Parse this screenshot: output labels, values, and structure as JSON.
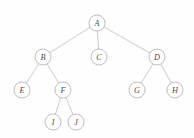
{
  "diagram": {
    "type": "tree",
    "background_color": "#fefefe",
    "node_fill_color": "#ffffff",
    "node_stroke_color": "#a8a8a8",
    "edge_color": "#b3b3b3",
    "label_color": "#4d4d4d",
    "node_radius": 8,
    "nodes": [
      {
        "id": "A",
        "label": "A",
        "x": 97,
        "y": 23,
        "level": 0
      },
      {
        "id": "B",
        "label": "B",
        "x": 43,
        "y": 57,
        "level": 1
      },
      {
        "id": "C",
        "label": "C",
        "x": 99,
        "y": 57,
        "level": 1
      },
      {
        "id": "D",
        "label": "D",
        "x": 157,
        "y": 57,
        "level": 1
      },
      {
        "id": "E",
        "label": "E",
        "x": 22,
        "y": 90,
        "level": 2
      },
      {
        "id": "F",
        "label": "F",
        "x": 63,
        "y": 90,
        "level": 2
      },
      {
        "id": "G",
        "label": "G",
        "x": 137,
        "y": 90,
        "level": 2
      },
      {
        "id": "H",
        "label": "H",
        "x": 175,
        "y": 90,
        "level": 2
      },
      {
        "id": "I",
        "label": "I",
        "x": 53,
        "y": 122,
        "level": 3
      },
      {
        "id": "J",
        "label": "J",
        "x": 76,
        "y": 122,
        "level": 3
      }
    ],
    "edges": [
      {
        "from": "A",
        "to": "B"
      },
      {
        "from": "A",
        "to": "C"
      },
      {
        "from": "A",
        "to": "D"
      },
      {
        "from": "B",
        "to": "E"
      },
      {
        "from": "B",
        "to": "F"
      },
      {
        "from": "D",
        "to": "G"
      },
      {
        "from": "D",
        "to": "H"
      },
      {
        "from": "F",
        "to": "I"
      },
      {
        "from": "F",
        "to": "J"
      }
    ]
  }
}
